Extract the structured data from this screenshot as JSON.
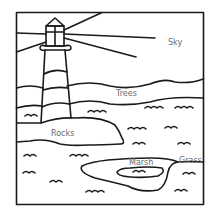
{
  "illustration": {
    "subject": "lighthouse coloring page",
    "labels": {
      "sky": "Sky",
      "trees": "Trees",
      "rocks": "Rocks",
      "marsh": "Marsh",
      "grass": "Grass"
    },
    "colors": {
      "line": "#1a1a1a",
      "label": "#6a6a6a",
      "background": "#ffffff"
    }
  }
}
